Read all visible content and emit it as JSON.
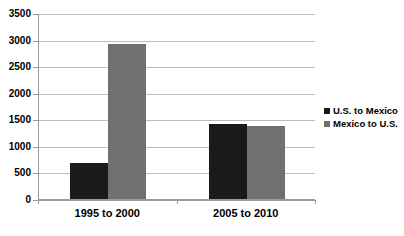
{
  "chart_data": {
    "type": "bar",
    "title": "",
    "subtitle": "",
    "xlabel": "",
    "ylabel": "",
    "categories": [
      "1995 to 2000",
      "2005 to 2010"
    ],
    "series": [
      {
        "name": "U.S. to Mexico",
        "color": "#1a1a1a",
        "values": [
          670,
          1410
        ]
      },
      {
        "name": "Mexico to U.S.",
        "color": "#707070",
        "values": [
          2920,
          1380
        ]
      }
    ],
    "ylim": [
      0,
      3500
    ],
    "ytick_step": 500,
    "yticks": [
      0,
      500,
      1000,
      1500,
      2000,
      2500,
      3000,
      3500
    ],
    "ytick_labels": [
      "0",
      "500",
      "1000",
      "1500",
      "2000",
      "2500",
      "3000",
      "3500"
    ],
    "grid": true,
    "grid_axis": "y",
    "legend": true,
    "legend_position": "right",
    "legend_entries": [
      "U.S. to Mexico",
      "Mexico to U.S."
    ],
    "background_color": "#ffffff",
    "gridline_color": "#bdbdbd",
    "axis_color": "#9a9a9a"
  }
}
